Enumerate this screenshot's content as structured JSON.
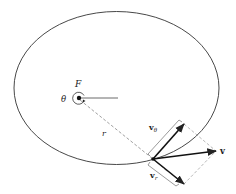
{
  "figure": {
    "labels": {
      "focus": "F",
      "angle": "θ",
      "radius": "r",
      "velocity": "v",
      "transverse_velocity_main": "v",
      "transverse_velocity_sub": "θ",
      "radial_velocity_main": "v",
      "radial_velocity_sub": "r"
    },
    "colors": {
      "stroke": "#222222",
      "dashed": "#777777",
      "background": "#ffffff"
    }
  }
}
